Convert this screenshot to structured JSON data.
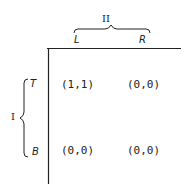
{
  "game": {
    "column_player": "II",
    "row_player": "I",
    "column_strategies": [
      "L",
      "R"
    ],
    "row_strategies": [
      "T",
      "B"
    ],
    "payoffs": [
      [
        "(1,1)",
        "(0,0)"
      ],
      [
        "(0,0)",
        "(0,0)"
      ]
    ]
  },
  "colors": {
    "ink": "#222222",
    "background": "#ffffff"
  }
}
